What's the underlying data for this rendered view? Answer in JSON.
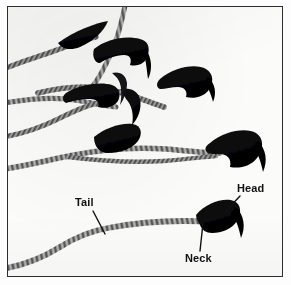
{
  "figure": {
    "background_color": "#fbfbfa",
    "ink_color": "#0b0b0d",
    "tail_color": "#70706e",
    "frame_color": "#2e2e30",
    "label_color": "#111113"
  },
  "labels": [
    {
      "id": "tail",
      "text": "Tail",
      "x": 74,
      "y": 205,
      "leader": {
        "x1": 92,
        "y1": 210,
        "x2": 104,
        "y2": 233
      }
    },
    {
      "id": "head",
      "text": "Head",
      "x": 236,
      "y": 191,
      "leader": {
        "x1": 239,
        "y1": 195,
        "x2": 224,
        "y2": 211
      }
    },
    {
      "id": "neck",
      "text": "Neck",
      "x": 184,
      "y": 250,
      "leader": {
        "x1": 199,
        "y1": 241,
        "x2": 202,
        "y2": 222
      }
    }
  ],
  "cells": [
    {
      "id": "cell-1",
      "position": "upper-left",
      "head": "hooked",
      "tail": "long-wavy"
    },
    {
      "id": "cell-2",
      "position": "upper-center",
      "head": "hooked",
      "tail": "long-wavy"
    },
    {
      "id": "cell-3",
      "position": "upper-right",
      "head": "hooked",
      "tail": "long-wavy"
    },
    {
      "id": "cell-4",
      "position": "mid-left",
      "head": "hooked",
      "tail": "long-wavy"
    },
    {
      "id": "cell-5",
      "position": "mid-center",
      "head": "hooked",
      "tail": "long-wavy"
    },
    {
      "id": "cell-6",
      "position": "mid-right",
      "head": "hooked",
      "tail": "long-wavy"
    },
    {
      "id": "cell-7",
      "position": "lower-right-labeled",
      "head": "hooked",
      "tail": "long-wavy"
    }
  ]
}
